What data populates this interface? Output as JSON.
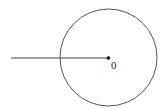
{
  "diagram": {
    "center_label": "0",
    "stroke_color": "#555555",
    "point_color": "#000000",
    "elements": [
      "circle",
      "radius-line",
      "center-point",
      "center-label"
    ]
  }
}
